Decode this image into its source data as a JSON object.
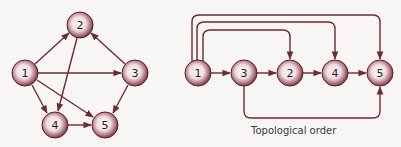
{
  "colors": {
    "edge": "#6e2a34",
    "node_rim": "#6b2733",
    "node_center": "#fdf7f8",
    "background": "#f7f6f5"
  },
  "left_graph": {
    "nodes": [
      {
        "id": "1",
        "label": "1",
        "x": 25,
        "y": 73
      },
      {
        "id": "2",
        "label": "2",
        "x": 80,
        "y": 25
      },
      {
        "id": "3",
        "label": "3",
        "x": 135,
        "y": 73
      },
      {
        "id": "4",
        "label": "4",
        "x": 55,
        "y": 125
      },
      {
        "id": "5",
        "label": "5",
        "x": 105,
        "y": 125
      }
    ],
    "edges": [
      {
        "from": "1",
        "to": "2"
      },
      {
        "from": "3",
        "to": "2"
      },
      {
        "from": "1",
        "to": "3"
      },
      {
        "from": "2",
        "to": "4"
      },
      {
        "from": "1",
        "to": "4"
      },
      {
        "from": "1",
        "to": "5"
      },
      {
        "from": "3",
        "to": "5"
      },
      {
        "from": "4",
        "to": "5"
      }
    ]
  },
  "right_graph": {
    "order": [
      "1",
      "3",
      "2",
      "4",
      "5"
    ],
    "nodes": [
      {
        "id": "1",
        "label": "1",
        "x": 198,
        "y": 73
      },
      {
        "id": "3",
        "label": "3",
        "x": 244,
        "y": 73
      },
      {
        "id": "2",
        "label": "2",
        "x": 290,
        "y": 73
      },
      {
        "id": "4",
        "label": "4",
        "x": 335,
        "y": 73
      },
      {
        "id": "5",
        "label": "5",
        "x": 380,
        "y": 73
      }
    ],
    "edges": [
      {
        "from": "1",
        "to": "3"
      },
      {
        "from": "3",
        "to": "2"
      },
      {
        "from": "2",
        "to": "4"
      },
      {
        "from": "4",
        "to": "5"
      },
      {
        "from": "1",
        "to": "2"
      },
      {
        "from": "1",
        "to": "4"
      },
      {
        "from": "1",
        "to": "5"
      },
      {
        "from": "3",
        "to": "5"
      }
    ],
    "caption": "Topological order"
  }
}
